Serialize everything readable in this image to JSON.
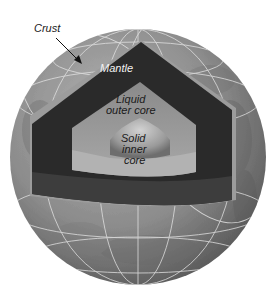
{
  "diagram": {
    "labels": {
      "crust": "Crust",
      "mantle": "Mantle",
      "outer_core_line1": "Liquid",
      "outer_core_line2": "outer core",
      "inner_core_line1": "Solid",
      "inner_core_line2": "inner",
      "inner_core_line3": "core"
    },
    "layers": [
      {
        "name": "Crust",
        "color": "#9a9a9a"
      },
      {
        "name": "Mantle",
        "color": "#2b2b2b"
      },
      {
        "name": "Liquid outer core",
        "color": "#8c8c8c"
      },
      {
        "name": "Solid inner core",
        "color": "#bdbdbd"
      }
    ],
    "colors": {
      "background": "#ffffff",
      "globe_surface": "#8f8f8f",
      "grid_lines": "#e0e0e0",
      "arrow": "#111111"
    }
  }
}
